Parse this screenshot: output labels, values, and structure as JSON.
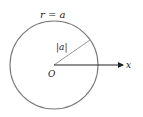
{
  "diagram": {
    "title_label": "r = a",
    "radius_label": "|a|",
    "origin_label": "O",
    "axis_label": "x",
    "colors": {
      "circle": "#7a7a7a",
      "radius_line": "#8a8a8a",
      "axis": "#222222",
      "text": "#222222",
      "background": "#ffffff"
    },
    "geometry": {
      "center": [
        54,
        65
      ],
      "radius": 44,
      "radius_endpoint": [
        90,
        40
      ],
      "axis_end": [
        123,
        65
      ]
    }
  }
}
